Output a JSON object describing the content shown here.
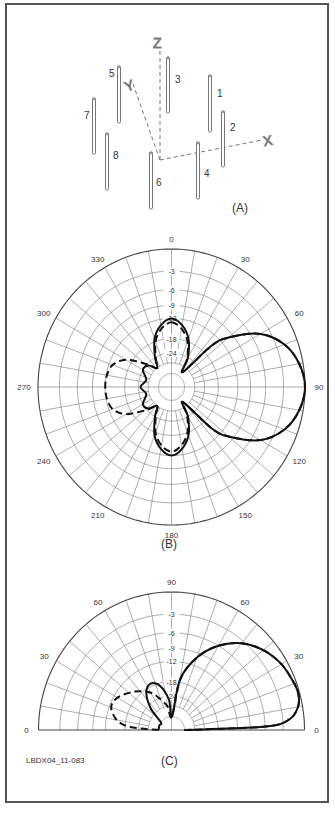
{
  "figure_id": "LBDX04_11-083",
  "panels": {
    "a": {
      "label": "(A)",
      "axes": {
        "x": "X",
        "y": "Y",
        "z": "Z"
      },
      "antennas": [
        {
          "id": "1",
          "x": 210,
          "top": 75,
          "bottom": 132,
          "lx": 217,
          "ly": 97
        },
        {
          "id": "2",
          "x": 223,
          "top": 111,
          "bottom": 167,
          "lx": 230,
          "ly": 131
        },
        {
          "id": "3",
          "x": 168,
          "top": 57,
          "bottom": 113,
          "lx": 175,
          "ly": 83
        },
        {
          "id": "4",
          "x": 198,
          "top": 142,
          "bottom": 199,
          "lx": 204,
          "ly": 177
        },
        {
          "id": "5",
          "x": 119,
          "top": 66,
          "bottom": 123,
          "lx": 109,
          "ly": 77
        },
        {
          "id": "6",
          "x": 151,
          "top": 152,
          "bottom": 209,
          "lx": 156,
          "ly": 186
        },
        {
          "id": "7",
          "x": 94,
          "top": 98,
          "bottom": 154,
          "lx": 84,
          "ly": 119
        },
        {
          "id": "8",
          "x": 107,
          "top": 133,
          "bottom": 190,
          "lx": 113,
          "ly": 159
        }
      ]
    },
    "b": {
      "label": "(B)"
    },
    "c": {
      "label": "(C)"
    }
  },
  "chart_data": [
    {
      "type": "polar",
      "title": "(B) Azimuth pattern",
      "angle_ticks": [
        0,
        30,
        60,
        90,
        120,
        150,
        180,
        210,
        240,
        270,
        300,
        330
      ],
      "radial_ticks_db": [
        -3,
        -6,
        -9,
        -12,
        -18,
        -24
      ],
      "radial_scale": "ARRL log-periodic (0 dB outer ring)",
      "series": [
        {
          "name": "solid",
          "style": "solid",
          "points": [
            [
              0,
              -12
            ],
            [
              10,
              -13.5
            ],
            [
              20,
              -17
            ],
            [
              30,
              -24
            ],
            [
              38,
              -34
            ],
            [
              45,
              -15
            ],
            [
              50,
              -10
            ],
            [
              60,
              -4.5
            ],
            [
              70,
              -1.8
            ],
            [
              80,
              -0.5
            ],
            [
              90,
              0
            ],
            [
              100,
              -0.5
            ],
            [
              110,
              -1.8
            ],
            [
              120,
              -4.5
            ],
            [
              130,
              -10
            ],
            [
              135,
              -15
            ],
            [
              142,
              -34
            ],
            [
              150,
              -24
            ],
            [
              160,
              -17
            ],
            [
              170,
              -13.5
            ],
            [
              180,
              -12
            ],
            [
              190,
              -13.5
            ],
            [
              200,
              -17
            ],
            [
              210,
              -24
            ],
            [
              218,
              -30
            ],
            [
              228,
              -25
            ],
            [
              240,
              -24
            ],
            [
              255,
              -28
            ],
            [
              270,
              -25
            ],
            [
              285,
              -28
            ],
            [
              300,
              -24
            ],
            [
              312,
              -25
            ],
            [
              322,
              -30
            ],
            [
              330,
              -24
            ],
            [
              340,
              -17
            ],
            [
              350,
              -13.5
            ]
          ]
        },
        {
          "name": "dashed",
          "style": "dashed",
          "points": [
            [
              0,
              -13
            ],
            [
              10,
              -14.5
            ],
            [
              20,
              -18
            ],
            [
              30,
              -25
            ],
            [
              38,
              -34
            ],
            [
              45,
              -15
            ],
            [
              50,
              -10
            ],
            [
              60,
              -4.5
            ],
            [
              70,
              -1.8
            ],
            [
              80,
              -0.5
            ],
            [
              90,
              0
            ],
            [
              100,
              -0.5
            ],
            [
              110,
              -1.8
            ],
            [
              120,
              -4.5
            ],
            [
              130,
              -10
            ],
            [
              135,
              -15
            ],
            [
              142,
              -34
            ],
            [
              150,
              -25
            ],
            [
              160,
              -18
            ],
            [
              170,
              -14.5
            ],
            [
              180,
              -13
            ],
            [
              190,
              -14.5
            ],
            [
              200,
              -18
            ],
            [
              210,
              -25
            ],
            [
              218,
              -30
            ],
            [
              228,
              -24
            ],
            [
              240,
              -16
            ],
            [
              250,
              -13
            ],
            [
              260,
              -12.2
            ],
            [
              270,
              -12
            ],
            [
              280,
              -12.2
            ],
            [
              290,
              -13
            ],
            [
              300,
              -16
            ],
            [
              312,
              -24
            ],
            [
              322,
              -30
            ],
            [
              330,
              -25
            ],
            [
              340,
              -18
            ],
            [
              350,
              -14.5
            ]
          ]
        }
      ]
    },
    {
      "type": "polar",
      "title": "(C) Elevation pattern",
      "angle_ticks": [
        0,
        30,
        60,
        90,
        60,
        30,
        0
      ],
      "radial_ticks_db": [
        -3,
        -6,
        -9,
        -12,
        -18,
        -24
      ],
      "radial_scale": "ARRL log-periodic (0 dB outer ring)",
      "series": [
        {
          "name": "solid",
          "style": "solid",
          "points": [
            [
              0,
              -40
            ],
            [
              2,
              -6
            ],
            [
              5,
              -2
            ],
            [
              10,
              -0.6
            ],
            [
              15,
              -0.2
            ],
            [
              20,
              -0.3
            ],
            [
              30,
              -0.8
            ],
            [
              40,
              -1.8
            ],
            [
              50,
              -3.4
            ],
            [
              60,
              -6
            ],
            [
              70,
              -10
            ],
            [
              80,
              -17
            ],
            [
              88,
              -40
            ],
            [
              95,
              -26
            ],
            [
              105,
              -19
            ],
            [
              115,
              -17
            ],
            [
              125,
              -19
            ],
            [
              135,
              -26
            ],
            [
              145,
              -40
            ],
            [
              160,
              -40
            ],
            [
              180,
              -40
            ]
          ]
        },
        {
          "name": "dashed",
          "style": "dashed",
          "points": [
            [
              0,
              -40
            ],
            [
              2,
              -6
            ],
            [
              5,
              -2
            ],
            [
              10,
              -0.6
            ],
            [
              15,
              -0.2
            ],
            [
              20,
              -0.3
            ],
            [
              30,
              -0.8
            ],
            [
              40,
              -1.8
            ],
            [
              50,
              -3.4
            ],
            [
              60,
              -6
            ],
            [
              70,
              -10
            ],
            [
              80,
              -17
            ],
            [
              88,
              -40
            ],
            [
              100,
              -30
            ],
            [
              110,
              -25
            ],
            [
              120,
              -20
            ],
            [
              135,
              -16
            ],
            [
              150,
              -13
            ],
            [
              160,
              -12.5
            ],
            [
              170,
              -15
            ],
            [
              176,
              -20
            ],
            [
              180,
              -40
            ]
          ]
        }
      ]
    }
  ]
}
